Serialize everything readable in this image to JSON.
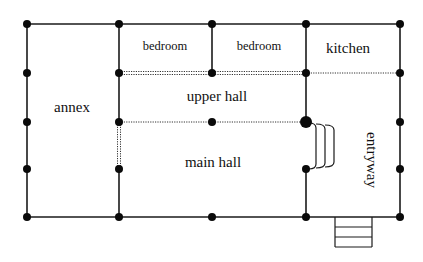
{
  "diagram": {
    "type": "floor-plan",
    "colors": {
      "wall": "#1a1a1a",
      "node": "#0a0a0a",
      "dotted": "#333333",
      "background": "#ffffff"
    },
    "rooms": [
      {
        "id": "annex",
        "label": "annex"
      },
      {
        "id": "bedroom-1",
        "label": "bedroom"
      },
      {
        "id": "bedroom-2",
        "label": "bedroom"
      },
      {
        "id": "kitchen",
        "label": "kitchen"
      },
      {
        "id": "upper-hall",
        "label": "upper hall"
      },
      {
        "id": "main-hall",
        "label": "main hall"
      },
      {
        "id": "entryway",
        "label": "entryway"
      }
    ]
  }
}
